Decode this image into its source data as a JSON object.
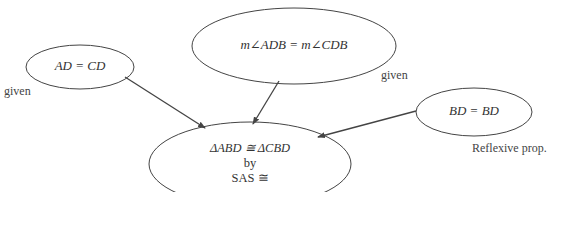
{
  "nodes": {
    "ad_cd": {
      "text": "AD = CD",
      "reason": "given"
    },
    "angles": {
      "text": "m∠ADB = m∠CDB",
      "reason": "given"
    },
    "bd_bd": {
      "text": "BD = BD",
      "reason": "Reflexive prop."
    },
    "conclusion": {
      "line1": "ΔABD ≅ ΔCBD",
      "line2": "by",
      "line3": "SAS ≅"
    }
  },
  "edges": [
    {
      "from": "ad_cd",
      "to": "conclusion"
    },
    {
      "from": "angles",
      "to": "conclusion"
    },
    {
      "from": "bd_bd",
      "to": "conclusion"
    }
  ],
  "colors": {
    "stroke": "#444444",
    "text": "#333333"
  }
}
